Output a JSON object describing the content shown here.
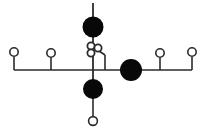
{
  "diagram": {
    "title": "",
    "background_color": "#ffffff",
    "line_color": "#2b2b2b",
    "filled_node_color": "#080808",
    "open_node_fill": "#ffffff",
    "canvas": {
      "width": 207,
      "height": 136
    },
    "backbone": {
      "label": "horizontal-backbone",
      "y": 70,
      "x_start": 14,
      "x_end": 192,
      "stroke_width": 1.6
    },
    "edges": [
      {
        "name": "stem-left-outer",
        "x1": 14,
        "y1": 57,
        "x2": 14,
        "y2": 70,
        "stroke_width": 1.6
      },
      {
        "name": "stem-left-inner",
        "x1": 51,
        "y1": 58,
        "x2": 51,
        "y2": 70,
        "stroke_width": 1.6
      },
      {
        "name": "stem-right-inner",
        "x1": 160,
        "y1": 58,
        "x2": 160,
        "y2": 70,
        "stroke_width": 1.6
      },
      {
        "name": "stem-right-outer",
        "x1": 192,
        "y1": 57,
        "x2": 192,
        "y2": 70,
        "stroke_width": 1.6
      },
      {
        "name": "stem-top-upper",
        "x1": 93,
        "y1": 3,
        "x2": 93,
        "y2": 20,
        "stroke_width": 1.8
      },
      {
        "name": "stem-top-lower",
        "x1": 93,
        "y1": 35,
        "x2": 93,
        "y2": 43,
        "stroke_width": 1.8
      },
      {
        "name": "stem-center-spine",
        "x1": 93,
        "y1": 56,
        "x2": 93,
        "y2": 80,
        "stroke_width": 1.8
      },
      {
        "name": "stem-bottom",
        "x1": 93,
        "y1": 98,
        "x2": 93,
        "y2": 117,
        "stroke_width": 1.6
      },
      {
        "name": "branch-elbow-horizontal",
        "x1": 99,
        "y1": 51,
        "x2": 105,
        "y2": 55,
        "stroke_width": 1.6
      },
      {
        "name": "branch-elbow-vertical",
        "x1": 105,
        "y1": 55,
        "x2": 105,
        "y2": 70,
        "stroke_width": 1.6
      }
    ],
    "nodes": [
      {
        "name": "open-node-left-outer",
        "type": "open",
        "cx": 14,
        "cy": 52,
        "r": 4.2,
        "stroke_width": 1.6
      },
      {
        "name": "open-node-left-inner",
        "type": "open",
        "cx": 51,
        "cy": 53,
        "r": 4.2,
        "stroke_width": 1.6
      },
      {
        "name": "open-node-right-inner",
        "type": "open",
        "cx": 160,
        "cy": 53,
        "r": 4.2,
        "stroke_width": 1.6
      },
      {
        "name": "open-node-right-outer",
        "type": "open",
        "cx": 192,
        "cy": 52,
        "r": 4.2,
        "stroke_width": 1.6
      },
      {
        "name": "filled-node-top",
        "type": "filled",
        "cx": 93,
        "cy": 27,
        "r": 10.5
      },
      {
        "name": "open-node-cluster-upper",
        "type": "open",
        "cx": 91,
        "cy": 46,
        "r": 3.6,
        "stroke_width": 1.8
      },
      {
        "name": "open-node-cluster-lower",
        "type": "open",
        "cx": 91,
        "cy": 53,
        "r": 3.6,
        "stroke_width": 1.8
      },
      {
        "name": "open-node-cluster-right",
        "type": "open",
        "cx": 98,
        "cy": 48,
        "r": 3.6,
        "stroke_width": 1.8
      },
      {
        "name": "filled-node-right",
        "type": "filled",
        "cx": 131,
        "cy": 70,
        "r": 11.0
      },
      {
        "name": "filled-node-bottom",
        "type": "filled",
        "cx": 93,
        "cy": 89,
        "r": 10.0
      },
      {
        "name": "open-node-bottom",
        "type": "open",
        "cx": 93,
        "cy": 121,
        "r": 4.4,
        "stroke_width": 1.6
      }
    ]
  }
}
